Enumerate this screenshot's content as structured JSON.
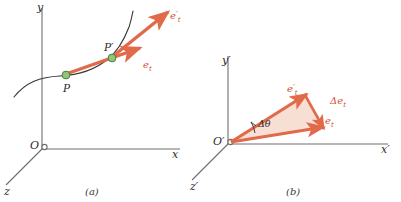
{
  "figure": {
    "width": 401,
    "height": 202,
    "background": "#ffffff"
  },
  "colors": {
    "vector": "#e06a4a",
    "vector_stroke": "#d4563a",
    "triangle_fill": "#f7d9cc",
    "axis": "#6e6e6e",
    "curve": "#3a3a3a",
    "point_fill": "#8fc77a",
    "point_stroke": "#4f7f3f",
    "label_text": "#2b2b2b",
    "vector_label_text": "#d4563a"
  },
  "panel_a": {
    "caption": "(a)",
    "axes": {
      "x_label": "x",
      "y_label": "y",
      "z_label": "z",
      "origin_label": "O"
    },
    "points": [
      {
        "id": "P",
        "label": "P"
      },
      {
        "id": "P-prime",
        "label": "P′"
      }
    ],
    "vectors": [
      {
        "id": "e-t",
        "label": "e",
        "subscript": "t",
        "prime": ""
      },
      {
        "id": "e-t-prime",
        "label": "e",
        "subscript": "t",
        "prime": "′"
      }
    ],
    "curve_name": "trajectory-curve"
  },
  "panel_b": {
    "caption": "(b)",
    "axes": {
      "x_label": "x′",
      "y_label": "y′",
      "z_label": "z′",
      "origin_label": "O′"
    },
    "vectors": [
      {
        "id": "e-t",
        "label": "e",
        "subscript": "t",
        "prime": ""
      },
      {
        "id": "e-t-prime",
        "label": "e",
        "subscript": "t",
        "prime": "′"
      },
      {
        "id": "delta-e-t",
        "label": "Δe",
        "subscript": "t",
        "prime": ""
      }
    ],
    "angle": {
      "id": "delta-theta",
      "label": "Δθ"
    }
  }
}
